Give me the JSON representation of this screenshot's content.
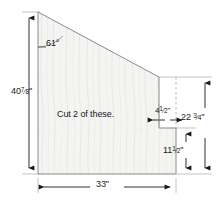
{
  "diagram": {
    "note": "Cut 2 of these.",
    "fill_color": "#f4f4f2",
    "line_color": "#6e6e6e",
    "dim_color": "#1a1a1a",
    "background": "#ffffff"
  },
  "dimensions": {
    "left_height": {
      "name": "left-height",
      "whole": "40",
      "numerator": "7",
      "denominator": "8",
      "unit": "\""
    },
    "angle": {
      "name": "top-left-angle",
      "value": "61",
      "unit": "°",
      "text": "61°"
    },
    "notch_width": {
      "name": "notch-width",
      "whole": "4",
      "numerator": "1",
      "denominator": "2",
      "unit": "\""
    },
    "right_upper_height": {
      "name": "right-upper-height",
      "whole": "22",
      "numerator": "3",
      "denominator": "4",
      "unit": "\""
    },
    "right_lower_height": {
      "name": "right-lower-height",
      "whole": "11",
      "numerator": "1",
      "denominator": "2",
      "unit": "\""
    },
    "bottom_width": {
      "name": "bottom-width",
      "whole": "33",
      "numerator": "",
      "denominator": "",
      "unit": "\""
    }
  }
}
